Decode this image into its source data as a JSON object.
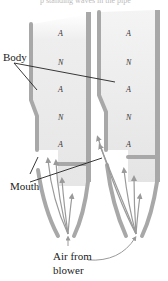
{
  "figure": {
    "top_caption_fragment": "p standing waves in the pipe",
    "labels": {
      "body": "Body",
      "mouth": "Mouth",
      "air_line1": "Air from",
      "air_line2": "blower"
    },
    "left_pipe": {
      "nodes": [
        "A",
        "N",
        "A",
        "N",
        "A"
      ]
    },
    "right_pipe": {
      "nodes": [
        "A",
        "N",
        "A",
        "N",
        "A"
      ]
    },
    "colors": {
      "pipe_wall": "#a8a8a8",
      "pipe_interior": "#ececec",
      "arrow": "#9a9a9a",
      "leader_line": "#222222",
      "text": "#222222"
    }
  }
}
